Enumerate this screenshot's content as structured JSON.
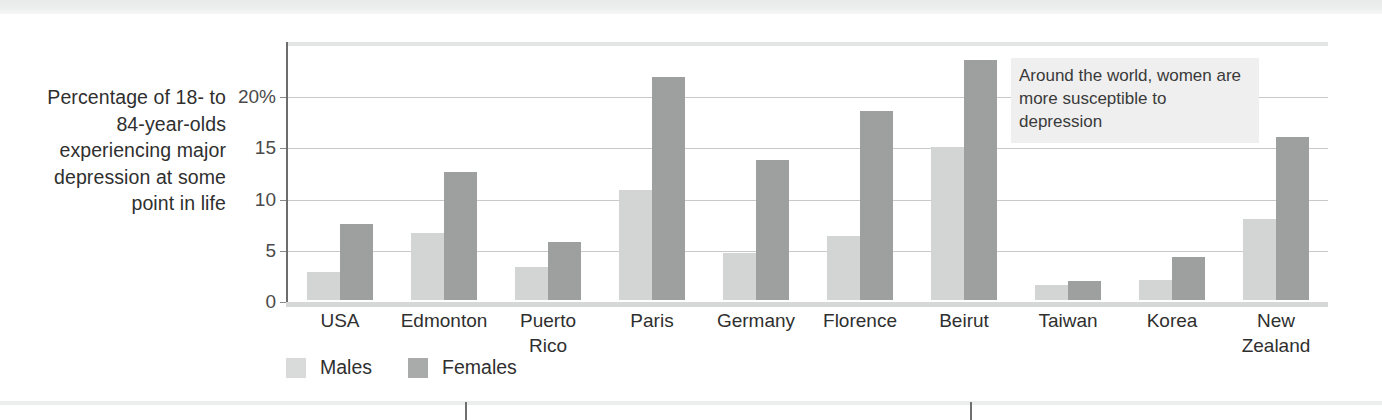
{
  "axis_title": "Percentage of 18-\nto 84-year-olds\nexperiencing\nmajor\ndepression\nat some\npoint in life",
  "annotation": "Around the world, women are more susceptible to depression",
  "legend": {
    "males_label": "Males",
    "females_label": "Females"
  },
  "colors": {
    "male_bar": "#d3d4d4",
    "female_bar": "#9e9f9f",
    "gridline": "#c9c9c9",
    "axis": "#6d6d6d",
    "annotation_bg": "#efefef",
    "text": "#2f2f2f"
  },
  "chart_data": {
    "type": "bar",
    "title": "",
    "xlabel": "",
    "ylabel": "Percentage of 18- to 84-year-olds experiencing major depression at some point in life",
    "ylim": [
      0,
      25
    ],
    "yticks": [
      0,
      5,
      10,
      15,
      20
    ],
    "ytick_labels": [
      "0",
      "5",
      "10",
      "15",
      "20%"
    ],
    "grid": true,
    "legend_position": "bottom-left",
    "categories": [
      "USA",
      "Edmonton",
      "Puerto\nRico",
      "Paris",
      "Germany",
      "Florence",
      "Beirut",
      "Taiwan",
      "Korea",
      "New\nZealand"
    ],
    "series": [
      {
        "name": "Males",
        "color": "#d3d4d4",
        "values": [
          2.7,
          6.5,
          3.2,
          10.7,
          4.6,
          6.3,
          14.9,
          1.5,
          2.0,
          7.9
        ]
      },
      {
        "name": "Females",
        "color": "#9e9f9f",
        "values": [
          7.4,
          12.5,
          5.7,
          21.8,
          13.7,
          18.5,
          23.4,
          1.9,
          4.2,
          15.9
        ]
      }
    ]
  }
}
